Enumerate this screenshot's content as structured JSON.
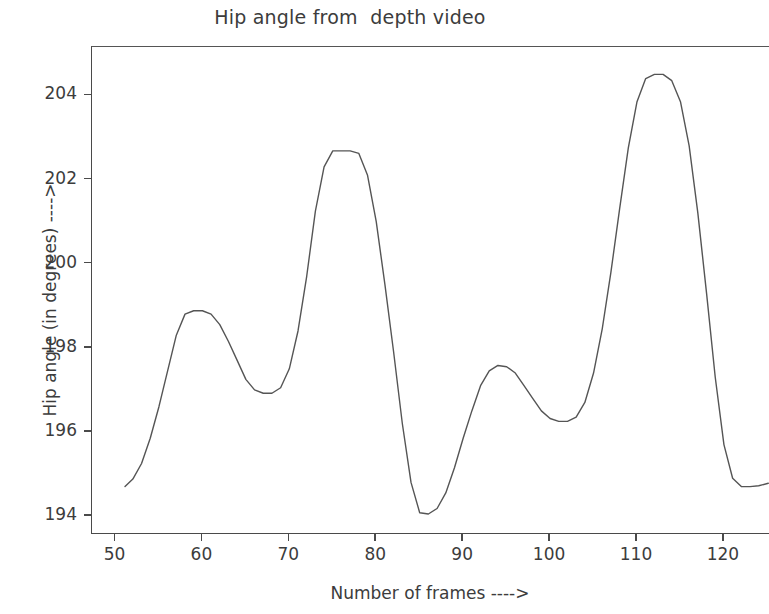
{
  "chart_data": {
    "type": "line",
    "title": "Hip angle from  depth video",
    "xlabel": "Number of frames ---->",
    "ylabel": "Hip angle (in degrees) ---->",
    "xlim": [
      47.3,
      125.3
    ],
    "ylim": [
      193.55,
      205.15
    ],
    "xticks": [
      50,
      60,
      70,
      80,
      90,
      100,
      110,
      120
    ],
    "yticks": [
      194,
      196,
      198,
      200,
      202,
      204
    ],
    "grid": false,
    "legend": null,
    "line_color": "#555555",
    "line_width": 1.4,
    "series": [
      {
        "name": "Hip angle",
        "x": [
          51.1,
          52.0,
          53.0,
          54.0,
          55.0,
          56.0,
          57.0,
          58.0,
          59.0,
          60.0,
          61.0,
          62.0,
          63.0,
          64.0,
          65.0,
          66.0,
          67.0,
          68.0,
          69.0,
          70.0,
          71.0,
          72.0,
          73.0,
          74.0,
          75.0,
          76.0,
          77.0,
          78.0,
          79.0,
          80.0,
          81.0,
          82.0,
          83.0,
          84.0,
          85.0,
          86.0,
          87.0,
          88.0,
          89.0,
          90.0,
          91.0,
          92.0,
          93.0,
          94.0,
          95.0,
          96.0,
          97.0,
          98.0,
          99.0,
          100.0,
          101.0,
          102.0,
          103.0,
          104.0,
          105.0,
          106.0,
          107.0,
          108.0,
          109.0,
          110.0,
          111.0,
          112.0,
          113.0,
          114.0,
          115.0,
          116.0,
          117.0,
          118.0,
          119.0,
          120.0,
          121.0,
          122.0,
          123.0,
          124.0,
          125.1
        ],
        "y": [
          194.7,
          194.88,
          195.25,
          195.85,
          196.6,
          197.45,
          198.3,
          198.8,
          198.88,
          198.88,
          198.8,
          198.55,
          198.15,
          197.7,
          197.25,
          197.0,
          196.92,
          196.92,
          197.05,
          197.5,
          198.4,
          199.7,
          201.25,
          202.3,
          202.68,
          202.68,
          202.68,
          202.62,
          202.1,
          201.0,
          199.5,
          197.9,
          196.2,
          194.8,
          194.08,
          194.05,
          194.18,
          194.55,
          195.15,
          195.85,
          196.5,
          197.1,
          197.45,
          197.58,
          197.55,
          197.4,
          197.1,
          196.8,
          196.5,
          196.32,
          196.25,
          196.25,
          196.35,
          196.7,
          197.4,
          198.45,
          199.8,
          201.3,
          202.75,
          203.85,
          204.4,
          204.5,
          204.5,
          204.35,
          203.85,
          202.8,
          201.2,
          199.3,
          197.3,
          195.7,
          194.9,
          194.7,
          194.7,
          194.72,
          194.78
        ]
      }
    ]
  }
}
